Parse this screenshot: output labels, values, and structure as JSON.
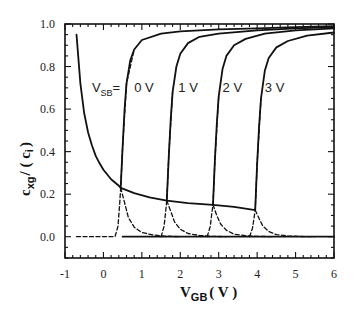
{
  "chart_data": {
    "type": "line",
    "title": "",
    "xlabel": "V_GB (V)",
    "ylabel": "c_xg / (c_i)",
    "xlim": [
      -1,
      6
    ],
    "ylim": [
      -0.1,
      1.0
    ],
    "x_ticks": [
      "-1",
      "0",
      "1",
      "2",
      "3",
      "4",
      "5",
      "6"
    ],
    "y_ticks": [
      "0.0",
      "0.2",
      "0.4",
      "0.6",
      "0.8",
      "1.0"
    ],
    "grid": false,
    "legend": null,
    "annotations": [
      {
        "text": "V_SB=",
        "x": -0.3,
        "y": 0.68
      },
      {
        "text": "0 V",
        "x": 0.8,
        "y": 0.68
      },
      {
        "text": "1 V",
        "x": 1.95,
        "y": 0.68
      },
      {
        "text": "2 V",
        "x": 3.1,
        "y": 0.68
      },
      {
        "text": "3 V",
        "x": 4.2,
        "y": 0.68
      }
    ],
    "series": [
      {
        "name": "c_gg total (V_SB=0 V)",
        "style": "solid",
        "x": [
          -0.7,
          -0.6,
          -0.5,
          -0.4,
          -0.3,
          -0.2,
          -0.1,
          0.0,
          0.2,
          0.4,
          0.45,
          0.5,
          0.55,
          0.6,
          0.7,
          0.8,
          1.0,
          1.5,
          2.0,
          3.0,
          4.0,
          5.0,
          6.0
        ],
        "y": [
          0.95,
          0.72,
          0.58,
          0.49,
          0.43,
          0.38,
          0.345,
          0.315,
          0.27,
          0.24,
          0.23,
          0.42,
          0.6,
          0.72,
          0.83,
          0.88,
          0.925,
          0.955,
          0.965,
          0.975,
          0.98,
          0.985,
          0.99
        ]
      },
      {
        "name": "c_gg total (V_SB=1 V)",
        "style": "solid",
        "x": [
          0.45,
          0.8,
          1.2,
          1.65,
          1.7,
          1.75,
          1.8,
          1.9,
          2.0,
          2.2,
          2.5,
          3.0,
          4.0,
          5.0,
          6.0
        ],
        "y": [
          0.23,
          0.205,
          0.185,
          0.17,
          0.38,
          0.55,
          0.68,
          0.8,
          0.86,
          0.91,
          0.94,
          0.955,
          0.97,
          0.98,
          0.985
        ]
      },
      {
        "name": "c_gg total (V_SB=2 V)",
        "style": "solid",
        "x": [
          1.65,
          2.2,
          2.85,
          2.9,
          2.95,
          3.0,
          3.1,
          3.2,
          3.4,
          3.7,
          4.2,
          5.0,
          6.0
        ],
        "y": [
          0.17,
          0.158,
          0.15,
          0.36,
          0.53,
          0.66,
          0.79,
          0.85,
          0.9,
          0.93,
          0.955,
          0.97,
          0.98
        ]
      },
      {
        "name": "c_gg total (V_SB=3 V)",
        "style": "solid",
        "x": [
          2.85,
          3.4,
          3.95,
          4.0,
          4.05,
          4.1,
          4.2,
          4.3,
          4.5,
          4.8,
          5.3,
          6.0
        ],
        "y": [
          0.15,
          0.14,
          0.125,
          0.34,
          0.52,
          0.65,
          0.78,
          0.84,
          0.89,
          0.92,
          0.945,
          0.96
        ]
      },
      {
        "name": "baseline",
        "style": "solid",
        "x": [
          0.5,
          6.0
        ],
        "y": [
          0.0,
          0.0
        ]
      },
      {
        "name": "inversion component (V_SB=0 V)",
        "style": "dashed",
        "x": [
          -0.7,
          0.3,
          0.38,
          0.42,
          0.45,
          0.5,
          0.6,
          0.8
        ],
        "y": [
          0.0,
          0.0,
          0.05,
          0.15,
          0.23,
          0.42,
          0.72,
          0.88
        ]
      },
      {
        "name": "depletion component (V_SB=0 V)",
        "style": "dashed",
        "x": [
          0.45,
          0.55,
          0.65,
          0.8,
          1.0,
          1.3,
          1.6,
          2.0
        ],
        "y": [
          0.23,
          0.16,
          0.09,
          0.045,
          0.02,
          0.008,
          0.003,
          0.0
        ]
      },
      {
        "name": "inversion component (V_SB=1 V)",
        "style": "dashed",
        "x": [
          1.5,
          1.58,
          1.62,
          1.65,
          1.7,
          1.8
        ],
        "y": [
          0.0,
          0.05,
          0.12,
          0.17,
          0.38,
          0.68
        ]
      },
      {
        "name": "depletion component (V_SB=1 V)",
        "style": "dashed",
        "x": [
          1.65,
          1.75,
          1.85,
          2.0,
          2.2,
          2.5,
          2.8,
          3.2
        ],
        "y": [
          0.17,
          0.12,
          0.07,
          0.035,
          0.015,
          0.006,
          0.002,
          0.0
        ]
      },
      {
        "name": "inversion component (V_SB=2 V)",
        "style": "dashed",
        "x": [
          2.7,
          2.78,
          2.82,
          2.85,
          2.9,
          3.0
        ],
        "y": [
          0.0,
          0.05,
          0.11,
          0.15,
          0.36,
          0.66
        ]
      },
      {
        "name": "depletion component (V_SB=2 V)",
        "style": "dashed",
        "x": [
          2.85,
          2.95,
          3.05,
          3.2,
          3.4,
          3.7,
          4.0,
          4.4
        ],
        "y": [
          0.15,
          0.1,
          0.06,
          0.03,
          0.012,
          0.005,
          0.002,
          0.0
        ]
      },
      {
        "name": "inversion component (V_SB=3 V)",
        "style": "dashed",
        "x": [
          3.8,
          3.88,
          3.92,
          3.95,
          4.0,
          4.1
        ],
        "y": [
          0.0,
          0.04,
          0.09,
          0.125,
          0.34,
          0.65
        ]
      },
      {
        "name": "depletion component (V_SB=3 V)",
        "style": "dashed",
        "x": [
          3.95,
          4.05,
          4.15,
          4.3,
          4.5,
          4.8,
          5.1,
          5.5
        ],
        "y": [
          0.125,
          0.085,
          0.05,
          0.025,
          0.01,
          0.004,
          0.001,
          0.0
        ]
      }
    ]
  },
  "labels": {
    "ylabel_main": "c",
    "ylabel_sub": "xg",
    "ylabel_rest": "/ ( c",
    "ylabel_sub2": "i",
    "ylabel_close": ")",
    "xlabel_main": "V",
    "xlabel_sub": "GB",
    "xlabel_rest": "( V )",
    "vsb_main": "V",
    "vsb_sub": "SB",
    "vsb_eq": "="
  }
}
